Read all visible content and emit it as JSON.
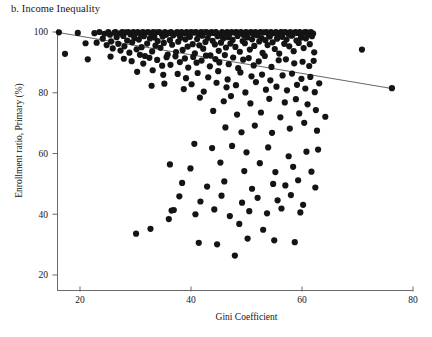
{
  "figure": {
    "panel_label": "b. Income Inequality",
    "xlabel": "Gini Coefficient",
    "ylabel": "Enrollment ratio, Primary (%)"
  },
  "chart_data": {
    "type": "scatter",
    "title": "b. Income Inequality",
    "xlabel": "Gini Coefficient",
    "ylabel": "Enrollment ratio, Primary (%)",
    "xlim": [
      15,
      80
    ],
    "ylim": [
      17,
      103
    ],
    "xticks": [
      20,
      40,
      60,
      80
    ],
    "yticks": [
      20,
      40,
      60,
      80,
      100
    ],
    "grid": false,
    "legend": null,
    "marker": {
      "shape": "circle",
      "color": "#141414",
      "size_px": 3.1
    },
    "trendline": {
      "type": "linear",
      "color": "#555555",
      "x_start": 16.2,
      "y_start": 99.8,
      "x_end": 76.5,
      "y_end": 81.3
    },
    "points": [
      [
        16.2,
        99.9
      ],
      [
        17.3,
        92.8
      ],
      [
        19.6,
        99.7
      ],
      [
        21.0,
        96.3
      ],
      [
        21.4,
        91.0
      ],
      [
        22.6,
        99.6
      ],
      [
        23.0,
        96.5
      ],
      [
        23.5,
        100.0
      ],
      [
        24.1,
        97.8
      ],
      [
        24.4,
        99.4
      ],
      [
        24.8,
        95.7
      ],
      [
        25.1,
        100.0
      ],
      [
        25.4,
        99.1
      ],
      [
        25.6,
        96.9
      ],
      [
        25.9,
        94.6
      ],
      [
        26.2,
        99.8
      ],
      [
        26.4,
        100.0
      ],
      [
        26.6,
        98.3
      ],
      [
        26.9,
        96.1
      ],
      [
        27.1,
        99.5
      ],
      [
        27.3,
        93.9
      ],
      [
        27.6,
        100.0
      ],
      [
        27.8,
        98.7
      ],
      [
        28.0,
        95.3
      ],
      [
        28.2,
        99.9
      ],
      [
        28.5,
        97.2
      ],
      [
        28.7,
        100.0
      ],
      [
        28.9,
        93.2
      ],
      [
        29.1,
        99.2
      ],
      [
        29.4,
        96.6
      ],
      [
        29.6,
        100.0
      ],
      [
        29.8,
        98.0
      ],
      [
        30.0,
        99.6
      ],
      [
        30.2,
        94.3
      ],
      [
        30.4,
        100.0
      ],
      [
        30.6,
        97.5
      ],
      [
        30.9,
        99.3
      ],
      [
        31.1,
        95.0
      ],
      [
        31.3,
        100.0
      ],
      [
        31.5,
        98.6
      ],
      [
        31.7,
        92.1
      ],
      [
        31.9,
        99.8
      ],
      [
        32.1,
        96.2
      ],
      [
        32.3,
        100.0
      ],
      [
        32.6,
        97.9
      ],
      [
        32.8,
        99.5
      ],
      [
        33.0,
        93.6
      ],
      [
        33.2,
        100.0
      ],
      [
        33.4,
        98.2
      ],
      [
        33.6,
        95.5
      ],
      [
        33.8,
        99.9
      ],
      [
        34.0,
        97.0
      ],
      [
        34.3,
        100.0
      ],
      [
        34.5,
        94.8
      ],
      [
        34.7,
        99.4
      ],
      [
        34.9,
        98.5
      ],
      [
        35.1,
        96.4
      ],
      [
        35.3,
        100.0
      ],
      [
        35.5,
        99.1
      ],
      [
        35.8,
        92.6
      ],
      [
        36.0,
        99.7
      ],
      [
        36.2,
        97.3
      ],
      [
        36.4,
        100.0
      ],
      [
        36.6,
        95.8
      ],
      [
        36.8,
        98.9
      ],
      [
        37.0,
        99.5
      ],
      [
        37.3,
        93.4
      ],
      [
        37.5,
        100.0
      ],
      [
        37.7,
        96.8
      ],
      [
        37.9,
        99.0
      ],
      [
        38.1,
        98.1
      ],
      [
        38.3,
        100.0
      ],
      [
        38.5,
        94.1
      ],
      [
        38.8,
        99.6
      ],
      [
        39.0,
        97.6
      ],
      [
        39.2,
        100.0
      ],
      [
        39.4,
        95.2
      ],
      [
        39.6,
        99.2
      ],
      [
        39.8,
        98.4
      ],
      [
        40.0,
        100.0
      ],
      [
        40.3,
        96.0
      ],
      [
        40.5,
        99.8
      ],
      [
        40.7,
        93.0
      ],
      [
        40.9,
        100.0
      ],
      [
        41.1,
        97.7
      ],
      [
        41.3,
        99.3
      ],
      [
        41.5,
        95.6
      ],
      [
        41.8,
        100.0
      ],
      [
        42.0,
        98.8
      ],
      [
        42.2,
        94.5
      ],
      [
        42.4,
        99.9
      ],
      [
        42.6,
        96.7
      ],
      [
        42.8,
        100.0
      ],
      [
        43.0,
        98.0
      ],
      [
        43.3,
        99.4
      ],
      [
        43.5,
        92.3
      ],
      [
        43.7,
        100.0
      ],
      [
        43.9,
        97.1
      ],
      [
        44.1,
        99.7
      ],
      [
        44.3,
        95.9
      ],
      [
        44.5,
        100.0
      ],
      [
        44.8,
        98.6
      ],
      [
        45.0,
        93.8
      ],
      [
        45.2,
        99.1
      ],
      [
        45.4,
        96.5
      ],
      [
        45.6,
        100.0
      ],
      [
        45.8,
        97.9
      ],
      [
        46.0,
        99.6
      ],
      [
        46.3,
        94.9
      ],
      [
        46.5,
        100.0
      ],
      [
        46.7,
        98.3
      ],
      [
        46.9,
        99.2
      ],
      [
        47.1,
        96.2
      ],
      [
        47.3,
        100.0
      ],
      [
        47.5,
        97.4
      ],
      [
        47.8,
        99.8
      ],
      [
        48.0,
        95.1
      ],
      [
        48.2,
        100.0
      ],
      [
        48.4,
        98.7
      ],
      [
        48.6,
        99.5
      ],
      [
        48.8,
        93.5
      ],
      [
        49.0,
        100.0
      ],
      [
        49.3,
        97.0
      ],
      [
        49.5,
        99.0
      ],
      [
        49.7,
        96.3
      ],
      [
        49.9,
        100.0
      ],
      [
        50.1,
        98.2
      ],
      [
        50.3,
        99.7
      ],
      [
        50.6,
        94.2
      ],
      [
        50.8,
        100.0
      ],
      [
        51.0,
        97.6
      ],
      [
        51.2,
        99.3
      ],
      [
        51.4,
        95.4
      ],
      [
        51.6,
        100.0
      ],
      [
        51.9,
        98.9
      ],
      [
        52.1,
        99.5
      ],
      [
        52.3,
        96.9
      ],
      [
        52.5,
        100.0
      ],
      [
        52.7,
        98.0
      ],
      [
        52.9,
        93.1
      ],
      [
        53.1,
        99.9
      ],
      [
        53.4,
        97.3
      ],
      [
        53.6,
        100.0
      ],
      [
        53.8,
        95.7
      ],
      [
        54.0,
        99.1
      ],
      [
        54.2,
        98.5
      ],
      [
        54.4,
        100.0
      ],
      [
        54.7,
        96.6
      ],
      [
        54.9,
        99.6
      ],
      [
        55.1,
        94.4
      ],
      [
        55.3,
        100.0
      ],
      [
        55.5,
        97.8
      ],
      [
        55.7,
        99.2
      ],
      [
        55.9,
        92.9
      ],
      [
        56.2,
        100.0
      ],
      [
        56.4,
        98.4
      ],
      [
        56.6,
        99.8
      ],
      [
        56.8,
        96.1
      ],
      [
        57.0,
        100.0
      ],
      [
        57.2,
        97.5
      ],
      [
        57.5,
        99.4
      ],
      [
        57.7,
        95.3
      ],
      [
        57.9,
        100.0
      ],
      [
        58.1,
        98.8
      ],
      [
        58.3,
        99.0
      ],
      [
        58.5,
        93.7
      ],
      [
        58.8,
        100.0
      ],
      [
        59.0,
        97.2
      ],
      [
        59.2,
        99.7
      ],
      [
        59.4,
        96.4
      ],
      [
        59.6,
        100.0
      ],
      [
        59.8,
        98.1
      ],
      [
        60.0,
        99.3
      ],
      [
        60.3,
        94.7
      ],
      [
        60.5,
        100.0
      ],
      [
        60.7,
        97.9
      ],
      [
        60.9,
        99.9
      ],
      [
        61.1,
        99.1
      ],
      [
        61.4,
        96.0
      ],
      [
        61.6,
        100.0
      ],
      [
        61.8,
        98.6
      ],
      [
        62.0,
        99.5
      ],
      [
        62.2,
        93.3
      ],
      [
        25.5,
        91.9
      ],
      [
        27.9,
        91.2
      ],
      [
        29.3,
        90.4
      ],
      [
        30.8,
        92.5
      ],
      [
        31.4,
        89.6
      ],
      [
        32.5,
        91.5
      ],
      [
        33.9,
        90.8
      ],
      [
        34.8,
        88.9
      ],
      [
        35.6,
        91.7
      ],
      [
        36.3,
        89.2
      ],
      [
        37.2,
        92.0
      ],
      [
        38.0,
        90.1
      ],
      [
        38.9,
        91.3
      ],
      [
        39.5,
        88.3
      ],
      [
        40.4,
        91.8
      ],
      [
        41.0,
        89.9
      ],
      [
        41.9,
        90.6
      ],
      [
        42.7,
        92.2
      ],
      [
        43.4,
        88.7
      ],
      [
        44.4,
        91.1
      ],
      [
        45.1,
        90.0
      ],
      [
        46.1,
        92.4
      ],
      [
        46.8,
        89.4
      ],
      [
        47.6,
        91.6
      ],
      [
        48.5,
        88.1
      ],
      [
        49.4,
        90.9
      ],
      [
        50.4,
        91.4
      ],
      [
        51.3,
        89.0
      ],
      [
        52.2,
        90.3
      ],
      [
        53.3,
        92.1
      ],
      [
        54.5,
        88.5
      ],
      [
        55.8,
        90.7
      ],
      [
        57.1,
        91.0
      ],
      [
        58.6,
        89.7
      ],
      [
        60.1,
        90.2
      ],
      [
        61.3,
        88.8
      ],
      [
        62.1,
        90.5
      ],
      [
        30.3,
        86.9
      ],
      [
        33.1,
        87.4
      ],
      [
        35.0,
        85.9
      ],
      [
        37.6,
        86.2
      ],
      [
        39.1,
        84.8
      ],
      [
        41.2,
        86.5
      ],
      [
        43.1,
        85.1
      ],
      [
        44.9,
        87.1
      ],
      [
        46.6,
        84.4
      ],
      [
        48.9,
        86.7
      ],
      [
        50.9,
        85.4
      ],
      [
        52.8,
        86.0
      ],
      [
        54.3,
        84.1
      ],
      [
        56.5,
        85.7
      ],
      [
        58.2,
        86.3
      ],
      [
        59.9,
        84.6
      ],
      [
        61.5,
        85.2
      ],
      [
        70.8,
        94.2
      ],
      [
        76.2,
        81.5
      ],
      [
        32.9,
        82.3
      ],
      [
        35.2,
        83.0
      ],
      [
        38.7,
        81.2
      ],
      [
        40.1,
        82.8
      ],
      [
        42.3,
        80.4
      ],
      [
        44.6,
        83.3
      ],
      [
        46.4,
        81.8
      ],
      [
        48.1,
        82.5
      ],
      [
        49.8,
        80.1
      ],
      [
        51.7,
        83.5
      ],
      [
        53.5,
        81.0
      ],
      [
        55.4,
        82.0
      ],
      [
        57.3,
        80.8
      ],
      [
        59.1,
        82.6
      ],
      [
        60.6,
        81.4
      ],
      [
        62.3,
        80.2
      ],
      [
        63.1,
        83.1
      ],
      [
        41.6,
        78.4
      ],
      [
        45.9,
        77.2
      ],
      [
        47.2,
        78.9
      ],
      [
        50.7,
        76.5
      ],
      [
        54.1,
        78.0
      ],
      [
        56.9,
        76.8
      ],
      [
        58.9,
        77.9
      ],
      [
        61.0,
        76.2
      ],
      [
        44.0,
        74.0
      ],
      [
        48.3,
        72.8
      ],
      [
        52.6,
        73.5
      ],
      [
        56.1,
        71.9
      ],
      [
        59.5,
        73.2
      ],
      [
        62.5,
        74.3
      ],
      [
        64.2,
        72.1
      ],
      [
        46.2,
        68.6
      ],
      [
        49.1,
        67.0
      ],
      [
        51.5,
        69.2
      ],
      [
        54.6,
        66.8
      ],
      [
        57.8,
        68.2
      ],
      [
        60.4,
        70.1
      ],
      [
        62.7,
        67.5
      ],
      [
        40.6,
        63.2
      ],
      [
        43.8,
        61.8
      ],
      [
        47.4,
        62.5
      ],
      [
        50.0,
        60.4
      ],
      [
        53.9,
        62.0
      ],
      [
        57.6,
        59.1
      ],
      [
        60.8,
        60.6
      ],
      [
        62.9,
        61.3
      ],
      [
        36.2,
        56.4
      ],
      [
        39.9,
        55.1
      ],
      [
        45.3,
        57.0
      ],
      [
        49.6,
        54.2
      ],
      [
        52.4,
        56.8
      ],
      [
        55.2,
        53.9
      ],
      [
        58.4,
        55.6
      ],
      [
        61.7,
        54.0
      ],
      [
        38.4,
        50.3
      ],
      [
        42.9,
        49.1
      ],
      [
        46.0,
        50.8
      ],
      [
        51.0,
        48.4
      ],
      [
        54.8,
        50.0
      ],
      [
        57.0,
        49.5
      ],
      [
        59.3,
        51.2
      ],
      [
        62.4,
        48.8
      ],
      [
        37.9,
        45.9
      ],
      [
        41.7,
        44.2
      ],
      [
        45.5,
        46.1
      ],
      [
        49.2,
        43.8
      ],
      [
        52.0,
        45.4
      ],
      [
        55.6,
        44.6
      ],
      [
        58.0,
        46.3
      ],
      [
        60.2,
        43.1
      ],
      [
        36.5,
        41.2
      ],
      [
        40.8,
        40.0
      ],
      [
        44.2,
        41.6
      ],
      [
        47.0,
        39.4
      ],
      [
        50.5,
        41.0
      ],
      [
        53.7,
        40.3
      ],
      [
        56.3,
        41.9
      ],
      [
        59.7,
        40.6
      ],
      [
        30.1,
        33.6
      ],
      [
        32.7,
        35.2
      ],
      [
        36.0,
        38.4
      ],
      [
        36.9,
        41.4
      ],
      [
        41.4,
        30.6
      ],
      [
        44.7,
        30.1
      ],
      [
        48.7,
        36.8
      ],
      [
        50.2,
        32.0
      ],
      [
        53.0,
        34.9
      ],
      [
        55.0,
        31.4
      ],
      [
        58.7,
        30.8
      ],
      [
        47.9,
        26.4
      ]
    ]
  }
}
